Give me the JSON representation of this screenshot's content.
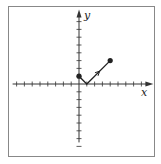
{
  "figure": {
    "type": "parametric-curve-diagram",
    "axes": {
      "x_label": "x",
      "y_label": "y",
      "x_ticks_negative": 8,
      "x_ticks_positive": 8,
      "y_ticks_positive": 8,
      "y_ticks_negative": 8,
      "tick_unit": 1
    },
    "curve": {
      "points": [
        [
          0,
          1
        ],
        [
          1,
          0
        ],
        [
          4,
          3
        ]
      ],
      "start_point": [
        0,
        1
      ],
      "end_point": [
        4,
        3
      ],
      "direction_arrow_on_segment": 2,
      "color": "#222222"
    },
    "frame_color": "#888888",
    "axis_color": "#333333"
  }
}
